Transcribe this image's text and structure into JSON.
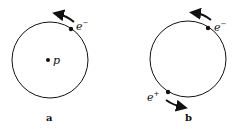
{
  "figure": {
    "panels": [
      {
        "caption": "a",
        "center_particle": {
          "symbol": "p"
        },
        "orbiting_particles": [
          {
            "symbol": "e",
            "charge": "−",
            "direction": "counterclockwise"
          }
        ]
      },
      {
        "caption": "b",
        "orbiting_particles": [
          {
            "symbol": "e",
            "charge": "−",
            "direction": "counterclockwise"
          },
          {
            "symbol": "e",
            "charge": "+",
            "direction": "counterclockwise"
          }
        ]
      }
    ],
    "colors": {
      "ink": "#111111",
      "background": "#ffffff"
    }
  }
}
